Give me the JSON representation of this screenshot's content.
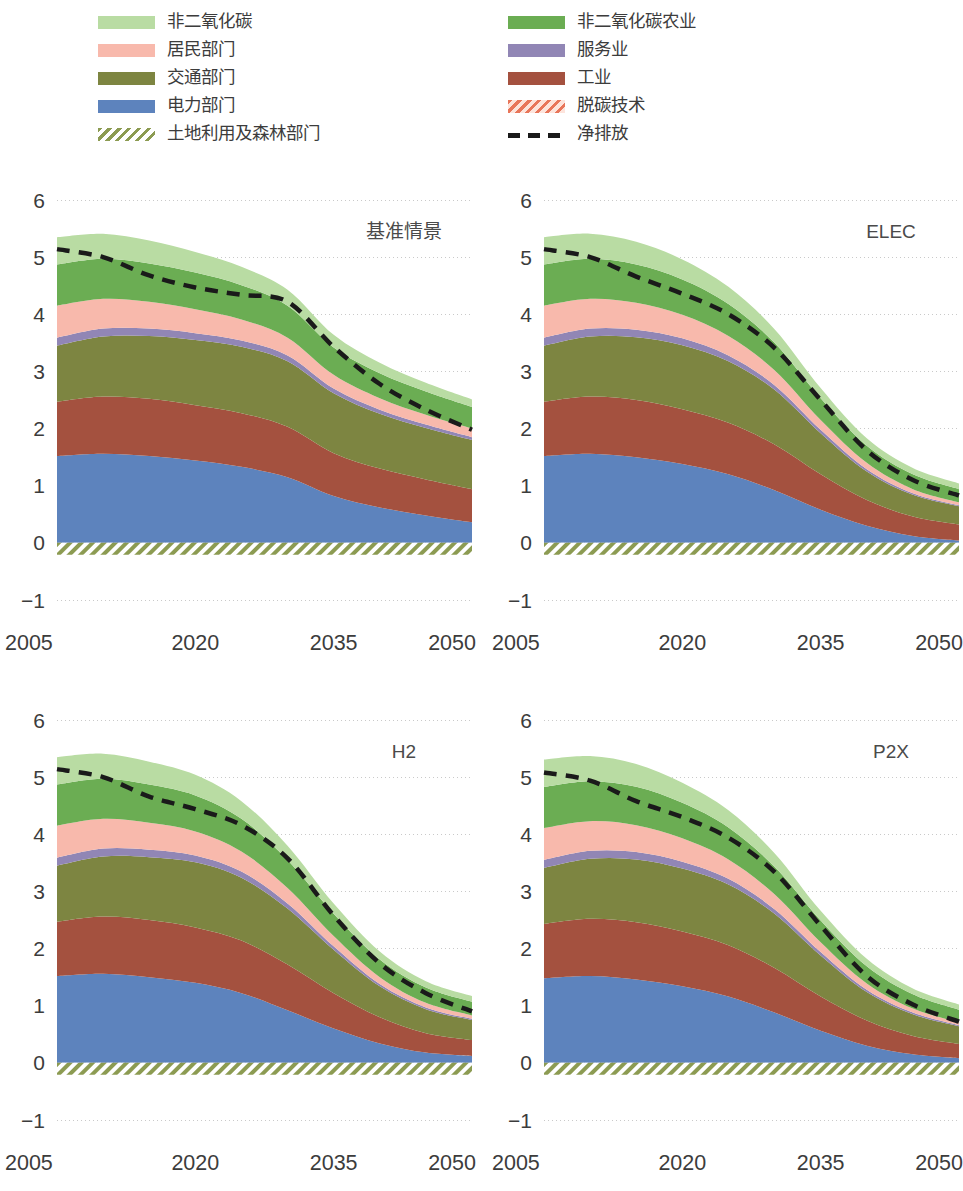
{
  "legend": {
    "left_column": [
      {
        "label": "非二氧化碳",
        "key": "nonco2",
        "color": "#b9dca3",
        "style": "solid"
      },
      {
        "label": "居民部门",
        "key": "residential",
        "color": "#f8b9ac",
        "style": "solid"
      },
      {
        "label": "交通部门",
        "key": "transport",
        "color": "#7d8541",
        "style": "solid"
      },
      {
        "label": "电力部门",
        "key": "power",
        "color": "#5d83bd",
        "style": "solid"
      },
      {
        "label": "土地利用及森林部门",
        "key": "landuse",
        "color": "#8c9b52",
        "style": "hatch"
      }
    ],
    "right_column": [
      {
        "label": "非二氧化碳农业",
        "key": "nonco2_agri",
        "color": "#6bad53",
        "style": "solid"
      },
      {
        "label": "服务业",
        "key": "services",
        "color": "#9186b5",
        "style": "solid"
      },
      {
        "label": "工业",
        "key": "industry",
        "color": "#a4513f",
        "style": "solid"
      },
      {
        "label": "脱碳技术",
        "key": "ccs",
        "color": "#e8765a",
        "style": "hatch-orange"
      },
      {
        "label": "净排放",
        "key": "net",
        "color": "#1a1a1a",
        "style": "dashed-line"
      }
    ]
  },
  "axes": {
    "y_ticks": [
      "6",
      "5",
      "4",
      "3",
      "2",
      "1",
      "0",
      "-1"
    ],
    "x_ticks": [
      "2005",
      "2020",
      "2035",
      "2050"
    ],
    "ylim": [
      -1,
      6
    ],
    "xlim": [
      2005,
      2050
    ]
  },
  "chart_data": {
    "type": "area",
    "title": "",
    "xlabel": "",
    "ylabel": "",
    "ylim": [
      -1,
      6
    ],
    "xlim": [
      2005,
      2050
    ],
    "grid": "horizontal-dotted",
    "legend_position": "top",
    "stack_order_bottom_to_top": [
      "power",
      "industry",
      "transport",
      "services",
      "residential",
      "nonco2_agri",
      "nonco2"
    ],
    "x": [
      2005,
      2010,
      2015,
      2020,
      2025,
      2030,
      2035,
      2040,
      2045,
      2050
    ],
    "panels": [
      {
        "name": "基准情景",
        "series": [
          {
            "name": "电力部门",
            "key": "power",
            "values": [
              1.52,
              1.56,
              1.52,
              1.44,
              1.33,
              1.15,
              0.82,
              0.62,
              0.48,
              0.36
            ]
          },
          {
            "name": "工业",
            "key": "industry",
            "values": [
              0.95,
              1.0,
              1.0,
              0.97,
              0.94,
              0.88,
              0.75,
              0.68,
              0.63,
              0.58
            ]
          },
          {
            "name": "交通部门",
            "key": "transport",
            "values": [
              0.98,
              1.05,
              1.1,
              1.14,
              1.16,
              1.15,
              1.05,
              0.96,
              0.9,
              0.86
            ]
          },
          {
            "name": "服务业",
            "key": "services",
            "values": [
              0.14,
              0.14,
              0.13,
              0.12,
              0.11,
              0.1,
              0.08,
              0.07,
              0.06,
              0.05
            ]
          },
          {
            "name": "居民部门",
            "key": "residential",
            "values": [
              0.56,
              0.52,
              0.47,
              0.42,
              0.37,
              0.31,
              0.24,
              0.2,
              0.17,
              0.15
            ]
          },
          {
            "name": "非二氧化碳农业",
            "key": "nonco2_agri",
            "values": [
              0.72,
              0.7,
              0.67,
              0.64,
              0.6,
              0.56,
              0.48,
              0.44,
              0.41,
              0.38
            ]
          },
          {
            "name": "非二氧化碳",
            "key": "nonco2",
            "values": [
              0.48,
              0.44,
              0.4,
              0.36,
              0.32,
              0.28,
              0.22,
              0.18,
              0.15,
              0.13
            ]
          },
          {
            "name": "土地利用及森林部门",
            "key": "landuse",
            "values": [
              -0.21,
              -0.21,
              -0.21,
              -0.21,
              -0.21,
              -0.21,
              -0.21,
              -0.21,
              -0.21,
              -0.21
            ]
          }
        ],
        "net": [
          5.14,
          5.0,
          4.68,
          4.47,
          4.34,
          4.22,
          3.43,
          2.78,
          2.33,
          1.98
        ]
      },
      {
        "name": "ELEC",
        "series": [
          {
            "name": "电力部门",
            "key": "power",
            "values": [
              1.52,
              1.56,
              1.5,
              1.38,
              1.2,
              0.92,
              0.58,
              0.3,
              0.12,
              0.04
            ]
          },
          {
            "name": "工业",
            "key": "industry",
            "values": [
              0.95,
              1.0,
              1.0,
              0.96,
              0.9,
              0.8,
              0.62,
              0.45,
              0.34,
              0.28
            ]
          },
          {
            "name": "交通部门",
            "key": "transport",
            "values": [
              0.98,
              1.05,
              1.1,
              1.12,
              1.08,
              0.96,
              0.72,
              0.5,
              0.38,
              0.32
            ]
          },
          {
            "name": "服务业",
            "key": "services",
            "values": [
              0.14,
              0.14,
              0.13,
              0.12,
              0.1,
              0.08,
              0.06,
              0.04,
              0.03,
              0.02
            ]
          },
          {
            "name": "居民部门",
            "key": "residential",
            "values": [
              0.56,
              0.52,
              0.47,
              0.41,
              0.34,
              0.26,
              0.17,
              0.11,
              0.07,
              0.05
            ]
          },
          {
            "name": "非二氧化碳农业",
            "key": "nonco2_agri",
            "values": [
              0.72,
              0.7,
              0.67,
              0.62,
              0.56,
              0.48,
              0.38,
              0.3,
              0.26,
              0.23
            ]
          },
          {
            "name": "非二氧化碳",
            "key": "nonco2",
            "values": [
              0.48,
              0.44,
              0.4,
              0.35,
              0.3,
              0.24,
              0.18,
              0.13,
              0.11,
              0.1
            ]
          },
          {
            "name": "土地利用及森林部门",
            "key": "landuse",
            "values": [
              -0.21,
              -0.21,
              -0.21,
              -0.21,
              -0.21,
              -0.21,
              -0.21,
              -0.21,
              -0.21,
              -0.21
            ]
          }
        ],
        "net": [
          5.14,
          5.0,
          4.66,
          4.36,
          4.0,
          3.41,
          2.5,
          1.62,
          1.1,
          0.83
        ]
      },
      {
        "name": "H2",
        "series": [
          {
            "name": "电力部门",
            "key": "power",
            "values": [
              1.52,
              1.56,
              1.5,
              1.4,
              1.22,
              0.92,
              0.6,
              0.34,
              0.18,
              0.12
            ]
          },
          {
            "name": "工业",
            "key": "industry",
            "values": [
              0.95,
              1.0,
              1.0,
              0.97,
              0.92,
              0.8,
              0.62,
              0.46,
              0.34,
              0.28
            ]
          },
          {
            "name": "交通部门",
            "key": "transport",
            "values": [
              0.98,
              1.05,
              1.1,
              1.14,
              1.1,
              0.98,
              0.76,
              0.54,
              0.42,
              0.35
            ]
          },
          {
            "name": "服务业",
            "key": "services",
            "values": [
              0.14,
              0.14,
              0.13,
              0.12,
              0.11,
              0.09,
              0.06,
              0.04,
              0.03,
              0.02
            ]
          },
          {
            "name": "居民部门",
            "key": "residential",
            "values": [
              0.56,
              0.52,
              0.47,
              0.42,
              0.35,
              0.27,
              0.18,
              0.12,
              0.08,
              0.06
            ]
          },
          {
            "name": "非二氧化碳农业",
            "key": "nonco2_agri",
            "values": [
              0.72,
              0.7,
              0.67,
              0.63,
              0.57,
              0.49,
              0.39,
              0.31,
              0.27,
              0.24
            ]
          },
          {
            "name": "非二氧化碳",
            "key": "nonco2",
            "values": [
              0.48,
              0.44,
              0.4,
              0.36,
              0.31,
              0.25,
              0.18,
              0.14,
              0.11,
              0.1
            ]
          },
          {
            "name": "土地利用及森林部门",
            "key": "landuse",
            "values": [
              -0.21,
              -0.21,
              -0.21,
              -0.21,
              -0.21,
              -0.21,
              -0.21,
              -0.21,
              -0.21,
              -0.21
            ]
          }
        ],
        "net": [
          5.14,
          5.0,
          4.66,
          4.44,
          4.16,
          3.58,
          2.58,
          1.74,
          1.22,
          0.9
        ]
      },
      {
        "name": "P2X",
        "series": [
          {
            "name": "电力部门",
            "key": "power",
            "values": [
              1.48,
              1.52,
              1.46,
              1.34,
              1.16,
              0.88,
              0.56,
              0.3,
              0.15,
              0.08
            ]
          },
          {
            "name": "工业",
            "key": "industry",
            "values": [
              0.95,
              1.0,
              1.0,
              0.96,
              0.9,
              0.78,
              0.6,
              0.44,
              0.32,
              0.25
            ]
          },
          {
            "name": "交通部门",
            "key": "transport",
            "values": [
              0.98,
              1.05,
              1.1,
              1.1,
              1.06,
              0.95,
              0.72,
              0.5,
              0.38,
              0.31
            ]
          },
          {
            "name": "服务业",
            "key": "services",
            "values": [
              0.14,
              0.14,
              0.13,
              0.12,
              0.1,
              0.08,
              0.06,
              0.04,
              0.03,
              0.02
            ]
          },
          {
            "name": "居民部门",
            "key": "residential",
            "values": [
              0.56,
              0.52,
              0.47,
              0.41,
              0.34,
              0.26,
              0.17,
              0.11,
              0.07,
              0.05
            ]
          },
          {
            "name": "非二氧化碳农业",
            "key": "nonco2_agri",
            "values": [
              0.72,
              0.7,
              0.67,
              0.62,
              0.56,
              0.48,
              0.38,
              0.3,
              0.25,
              0.22
            ]
          },
          {
            "name": "非二氧化碳",
            "key": "nonco2",
            "values": [
              0.48,
              0.44,
              0.4,
              0.35,
              0.3,
              0.24,
              0.17,
              0.13,
              0.1,
              0.09
            ]
          },
          {
            "name": "土地利用及森林部门",
            "key": "landuse",
            "values": [
              -0.21,
              -0.21,
              -0.21,
              -0.21,
              -0.21,
              -0.21,
              -0.21,
              -0.21,
              -0.21,
              -0.21
            ]
          }
        ],
        "net": [
          5.08,
          4.94,
          4.58,
          4.3,
          3.94,
          3.34,
          2.4,
          1.52,
          1.02,
          0.72
        ]
      }
    ]
  }
}
